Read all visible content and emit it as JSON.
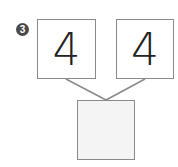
{
  "problem": {
    "number": "3",
    "left_value": "4",
    "right_value": "4",
    "answer_value": ""
  },
  "colors": {
    "border": "#8a8a8a",
    "badge": "#4a4a4a",
    "answer_fill": "#f4f4f4"
  }
}
